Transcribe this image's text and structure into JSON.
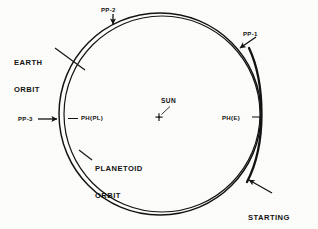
{
  "figure": {
    "background_color": "#fdfdfc",
    "ink_color": "#131313"
  },
  "labels": {
    "earth_orbit_line1": "EARTH",
    "earth_orbit_line2": "ORBIT",
    "planetoid_orbit_line1": "PLANETOID",
    "planetoid_orbit_line2": "ORBIT",
    "starting_point_line1": "STARTING",
    "starting_point_line2": "POINT",
    "sun": "SUN",
    "pp1": "PP-1",
    "pp2": "PP-2",
    "pp3": "PP-3",
    "ph_pl": "PH(PL)",
    "ph_e": "PH(E)"
  },
  "markers": {
    "sun_symbol": "+",
    "sun_x": 159,
    "sun_y": 117
  },
  "orbits": [
    {
      "name": "earth-orbit",
      "role": "outer ellipse",
      "center_x": 160,
      "center_y": 114,
      "radius_x": 101,
      "radius_y": 101
    },
    {
      "name": "planetoid-orbit",
      "role": "inner ellipse, converges with earth orbit near PH(E)",
      "center_x": 162,
      "center_y": 114,
      "radius_x": 98,
      "radius_y": 98
    }
  ],
  "annotations": [
    {
      "name": "pp-1",
      "type": "arrow",
      "points_to": "orbit upper-right"
    },
    {
      "name": "pp-2",
      "type": "arrow",
      "points_to": "orbit top"
    },
    {
      "name": "pp-3",
      "type": "arrow",
      "points_to": "orbit left at perihelion of planetoid"
    },
    {
      "name": "ph-pl",
      "type": "leader",
      "points_to": "planetoid orbit left"
    },
    {
      "name": "ph-e",
      "type": "leader",
      "points_to": "earth orbit right"
    },
    {
      "name": "starting-point",
      "type": "arrow",
      "points_to": "orbit lower-right"
    },
    {
      "name": "earth-orbit",
      "type": "leader",
      "points_to": "outer ellipse upper-left"
    },
    {
      "name": "planetoid-orbit",
      "type": "leader",
      "points_to": "inner ellipse lower-left"
    },
    {
      "name": "sun",
      "type": "leader",
      "points_to": "sun cross marker"
    }
  ]
}
